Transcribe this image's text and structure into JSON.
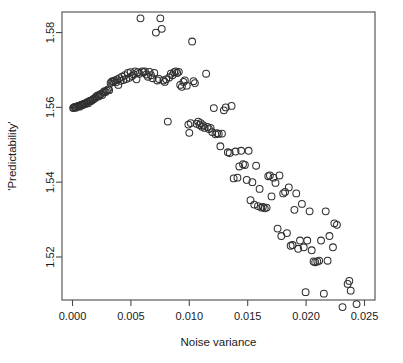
{
  "chart_data": {
    "type": "scatter",
    "title": "",
    "xlabel": "Noise variance",
    "ylabel": "'Predictability'",
    "xlim": [
      -0.0009,
      0.0259
    ],
    "ylim": [
      1.5085,
      1.5855
    ],
    "xticks": [
      0.0,
      0.005,
      0.01,
      0.015,
      0.02,
      0.025
    ],
    "xtick_labels": [
      "0.000",
      "0.005",
      "0.010",
      "0.015",
      "0.020",
      "0.025"
    ],
    "yticks": [
      1.52,
      1.54,
      1.56,
      1.58
    ],
    "ytick_labels": [
      "1.52",
      "1.54",
      "1.56",
      "1.58"
    ],
    "grid": false,
    "legend": null,
    "marker": "open-circle",
    "marker_color": "#303030",
    "marker_size": 3.4,
    "n_points": 158,
    "points": [
      [
        5e-05,
        1.5598
      ],
      [
        0.00012,
        1.56
      ],
      [
        0.0002,
        1.5601
      ],
      [
        0.00028,
        1.5599
      ],
      [
        0.00036,
        1.5602
      ],
      [
        0.00044,
        1.5603
      ],
      [
        0.00052,
        1.5604
      ],
      [
        0.0006,
        1.5602
      ],
      [
        0.00068,
        1.5606
      ],
      [
        0.00076,
        1.5605
      ],
      [
        0.00084,
        1.5608
      ],
      [
        0.00092,
        1.5607
      ],
      [
        0.001,
        1.561
      ],
      [
        0.0011,
        1.5609
      ],
      [
        0.00118,
        1.5612
      ],
      [
        0.00126,
        1.5614
      ],
      [
        0.00134,
        1.5611
      ],
      [
        0.00142,
        1.5616
      ],
      [
        0.00152,
        1.5618
      ],
      [
        0.0016,
        1.5617
      ],
      [
        0.0017,
        1.562
      ],
      [
        0.00178,
        1.5622
      ],
      [
        0.00188,
        1.5624
      ],
      [
        0.00196,
        1.5626
      ],
      [
        0.00206,
        1.563
      ],
      [
        0.00216,
        1.5632
      ],
      [
        0.00224,
        1.5629
      ],
      [
        0.00234,
        1.5634
      ],
      [
        0.00244,
        1.5636
      ],
      [
        0.00254,
        1.5633
      ],
      [
        0.00264,
        1.564
      ],
      [
        0.00274,
        1.5643
      ],
      [
        0.00284,
        1.5641
      ],
      [
        0.00294,
        1.5645
      ],
      [
        0.00304,
        1.5648
      ],
      [
        0.00314,
        1.5646
      ],
      [
        0.00326,
        1.5665
      ],
      [
        0.00334,
        1.5668
      ],
      [
        0.00342,
        1.567
      ],
      [
        0.00352,
        1.5669
      ],
      [
        0.00362,
        1.5672
      ],
      [
        0.00372,
        1.5667
      ],
      [
        0.00382,
        1.5675
      ],
      [
        0.00392,
        1.566
      ],
      [
        0.00402,
        1.5678
      ],
      [
        0.00412,
        1.5671
      ],
      [
        0.00424,
        1.5682
      ],
      [
        0.00436,
        1.5673
      ],
      [
        0.00448,
        1.5686
      ],
      [
        0.0046,
        1.5676
      ],
      [
        0.00474,
        1.5692
      ],
      [
        0.00486,
        1.5679
      ],
      [
        0.00498,
        1.5694
      ],
      [
        0.0051,
        1.5684
      ],
      [
        0.00524,
        1.5688
      ],
      [
        0.00536,
        1.5696
      ],
      [
        0.00548,
        1.5675
      ],
      [
        0.0056,
        1.5694
      ],
      [
        0.00572,
        1.569
      ],
      [
        0.00582,
        1.5838
      ],
      [
        0.00596,
        1.5696
      ],
      [
        0.00608,
        1.5694
      ],
      [
        0.0062,
        1.5696
      ],
      [
        0.00632,
        1.5688
      ],
      [
        0.00646,
        1.5682
      ],
      [
        0.0066,
        1.5695
      ],
      [
        0.00672,
        1.5686
      ],
      [
        0.00686,
        1.5678
      ],
      [
        0.007,
        1.5692
      ],
      [
        0.00714,
        1.58
      ],
      [
        0.00726,
        1.5672
      ],
      [
        0.0074,
        1.5676
      ],
      [
        0.00752,
        1.5838
      ],
      [
        0.00764,
        1.581
      ],
      [
        0.00778,
        1.5672
      ],
      [
        0.0079,
        1.5668
      ],
      [
        0.00802,
        1.5675
      ],
      [
        0.00816,
        1.5562
      ],
      [
        0.00828,
        1.568
      ],
      [
        0.00842,
        1.569
      ],
      [
        0.00856,
        1.5686
      ],
      [
        0.0087,
        1.5694
      ],
      [
        0.00884,
        1.5696
      ],
      [
        0.00896,
        1.5692
      ],
      [
        0.0091,
        1.5695
      ],
      [
        0.00922,
        1.566
      ],
      [
        0.00936,
        1.5655
      ],
      [
        0.0095,
        1.5668
      ],
      [
        0.00962,
        1.5672
      ],
      [
        0.00978,
        1.5658
      ],
      [
        0.00992,
        1.5554
      ],
      [
        0.01,
        1.5532
      ],
      [
        0.01012,
        1.5558
      ],
      [
        0.01024,
        1.5776
      ],
      [
        0.01036,
        1.567
      ],
      [
        0.01048,
        1.5665
      ],
      [
        0.01062,
        1.5556
      ],
      [
        0.01076,
        1.5562
      ],
      [
        0.01088,
        1.5553
      ],
      [
        0.01098,
        1.5558
      ],
      [
        0.01108,
        1.5548
      ],
      [
        0.0112,
        1.5552
      ],
      [
        0.01132,
        1.5545
      ],
      [
        0.01144,
        1.569
      ],
      [
        0.01156,
        1.5548
      ],
      [
        0.01168,
        1.5542
      ],
      [
        0.01182,
        1.5545
      ],
      [
        0.01196,
        1.5534
      ],
      [
        0.0121,
        1.5598
      ],
      [
        0.01224,
        1.5528
      ],
      [
        0.01238,
        1.5531
      ],
      [
        0.01252,
        1.5529
      ],
      [
        0.01266,
        1.5496
      ],
      [
        0.0128,
        1.553
      ],
      [
        0.01296,
        1.5592
      ],
      [
        0.01312,
        1.56
      ],
      [
        0.0133,
        1.548
      ],
      [
        0.01346,
        1.5478
      ],
      [
        0.01362,
        1.5604
      ],
      [
        0.0138,
        1.541
      ],
      [
        0.01396,
        1.5482
      ],
      [
        0.01412,
        1.5412
      ],
      [
        0.01428,
        1.5442
      ],
      [
        0.01444,
        1.5484
      ],
      [
        0.0146,
        1.5448
      ],
      [
        0.01476,
        1.5446
      ],
      [
        0.01492,
        1.5406
      ],
      [
        0.01508,
        1.5484
      ],
      [
        0.01524,
        1.5352
      ],
      [
        0.0154,
        1.54
      ],
      [
        0.01556,
        1.534
      ],
      [
        0.01572,
        1.5444
      ],
      [
        0.01588,
        1.5336
      ],
      [
        0.01602,
        1.5382
      ],
      [
        0.01616,
        1.5332
      ],
      [
        0.0163,
        1.5334
      ],
      [
        0.01646,
        1.533
      ],
      [
        0.01662,
        1.5332
      ],
      [
        0.01676,
        1.5416
      ],
      [
        0.0169,
        1.5418
      ],
      [
        0.01704,
        1.5362
      ],
      [
        0.0172,
        1.5412
      ],
      [
        0.01738,
        1.5398
      ],
      [
        0.01756,
        1.5276
      ],
      [
        0.01772,
        1.5418
      ],
      [
        0.01788,
        1.5256
      ],
      [
        0.01804,
        1.537
      ],
      [
        0.0182,
        1.5374
      ],
      [
        0.01836,
        1.5264
      ],
      [
        0.01852,
        1.5386
      ],
      [
        0.01868,
        1.523
      ],
      [
        0.01884,
        1.5232
      ],
      [
        0.019,
        1.5326
      ],
      [
        0.01916,
        1.537
      ],
      [
        0.01932,
        1.5222
      ],
      [
        0.01948,
        1.5244
      ],
      [
        0.01964,
        1.5342
      ],
      [
        0.0198,
        1.5226
      ],
      [
        0.01996,
        1.5106
      ],
      [
        0.0201,
        1.5244
      ],
      [
        0.0203,
        1.5322
      ],
      [
        0.02048,
        1.5218
      ],
      [
        0.02064,
        1.5188
      ],
      [
        0.02078,
        1.5186
      ],
      [
        0.02096,
        1.5188
      ],
      [
        0.02112,
        1.519
      ],
      [
        0.02128,
        1.5244
      ],
      [
        0.02152,
        1.5102
      ],
      [
        0.02168,
        1.5322
      ],
      [
        0.02184,
        1.519
      ],
      [
        0.022,
        1.5256
      ],
      [
        0.0223,
        1.5226
      ],
      [
        0.02242,
        1.529
      ],
      [
        0.02264,
        1.5286
      ],
      [
        0.02312,
        1.5066
      ],
      [
        0.02356,
        1.5128
      ],
      [
        0.0237,
        1.5136
      ],
      [
        0.02382,
        1.511
      ],
      [
        0.02432,
        1.5074
      ]
    ]
  },
  "axes": {
    "x_title": "Noise variance",
    "y_title": "'Predictability'"
  }
}
